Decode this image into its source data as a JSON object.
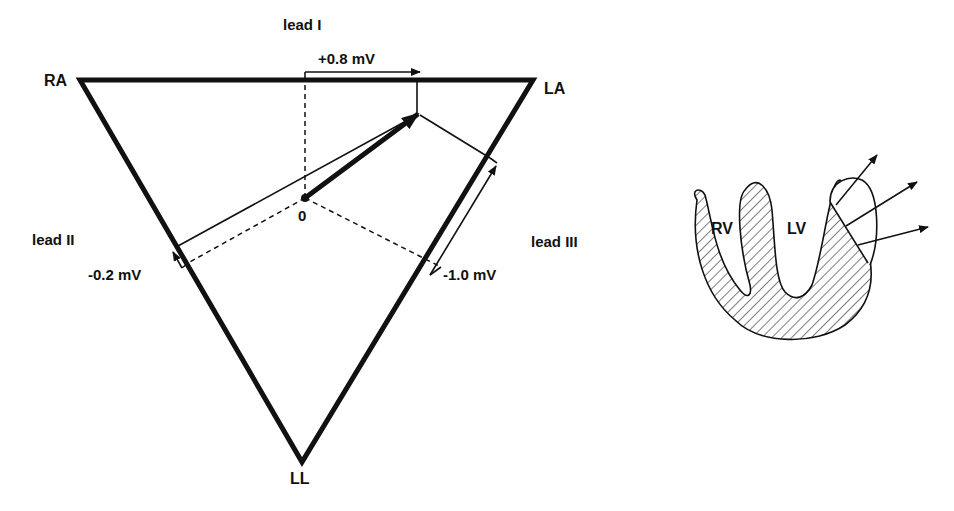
{
  "einthoven": {
    "vertices": {
      "ra": {
        "label": "RA"
      },
      "la": {
        "label": "LA"
      },
      "ll": {
        "label": "LL"
      }
    },
    "origin_label": "0",
    "leads": [
      {
        "name": "lead I",
        "value": "+0.8 mV"
      },
      {
        "name": "lead II",
        "value": "-0.2 mV"
      },
      {
        "name": "lead III",
        "value": "-1.0 mV"
      }
    ]
  },
  "heart": {
    "labels": {
      "rv": "RV",
      "lv": "LV"
    },
    "vector_count": 3
  },
  "colors": {
    "ink": "#111111",
    "background": "#ffffff"
  }
}
